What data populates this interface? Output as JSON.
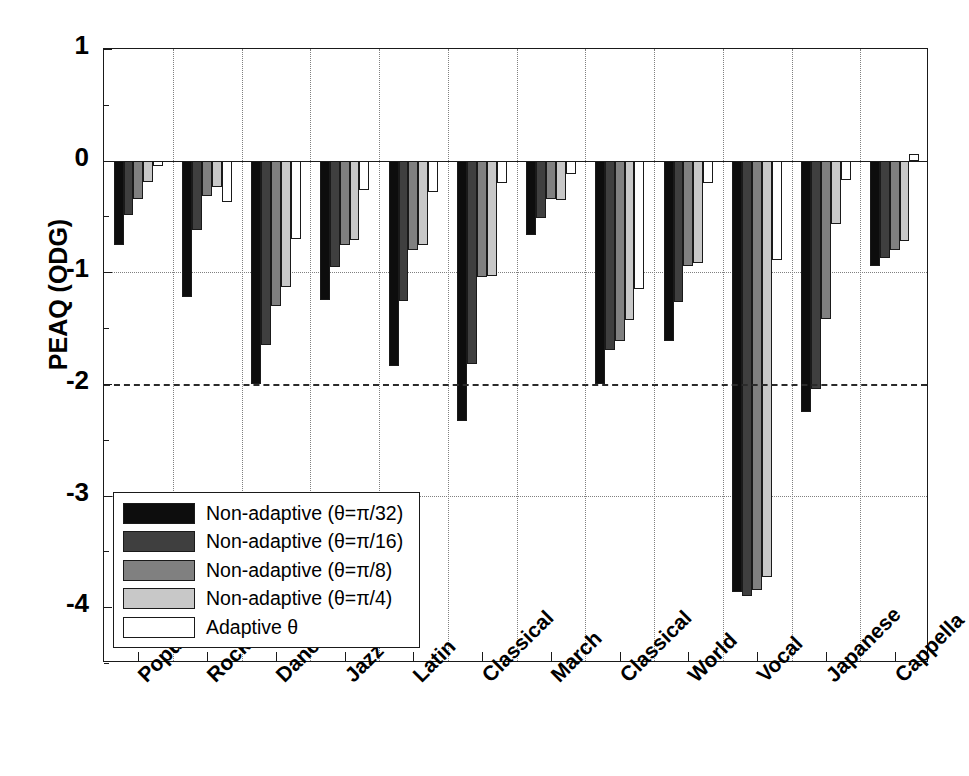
{
  "chart_data": {
    "type": "bar",
    "title": "",
    "xlabel": "",
    "ylabel": "PEAQ (ODG)",
    "ylim": [
      -4.5,
      1
    ],
    "yticks": [
      1,
      0,
      -1,
      -2,
      -3,
      -4
    ],
    "ytick_labels": [
      "1",
      "0",
      "-1",
      "-2",
      "-3",
      "-4"
    ],
    "grid": "dotted vertical gridlines between category groups; dotted horizontal gridlines at -1 and -3; solid zero line; dashed reference line at -2",
    "legend_position": "lower left, inside axes",
    "reference_line": -2,
    "categories": [
      "Popular",
      "Rock",
      "Dance",
      "Jazz",
      "Latin",
      "Classical",
      "March",
      "Classical",
      "World",
      "Vocal",
      "Japanese",
      "Cappella"
    ],
    "series": [
      {
        "name": "Non-adaptive (θ=π/32)",
        "color": "#0d0d0d",
        "values": [
          -0.76,
          -1.22,
          -2.0,
          -1.25,
          -1.84,
          -2.33,
          -0.67,
          -2.0,
          -1.62,
          -3.86,
          -2.25,
          -0.94
        ]
      },
      {
        "name": "Non-adaptive (θ=π/16)",
        "color": "#3f3f3f",
        "values": [
          -0.49,
          -0.62,
          -1.65,
          -0.95,
          -1.26,
          -1.82,
          -0.51,
          -1.7,
          -1.27,
          -3.9,
          -2.05,
          -0.87
        ]
      },
      {
        "name": "Non-adaptive (θ=π/8)",
        "color": "#808080",
        "values": [
          -0.34,
          -0.32,
          -1.3,
          -0.76,
          -0.8,
          -1.04,
          -0.34,
          -1.62,
          -0.94,
          -3.85,
          -1.42,
          -0.8
        ]
      },
      {
        "name": "Non-adaptive (θ=π/4)",
        "color": "#c8c8c8",
        "values": [
          -0.19,
          -0.24,
          -1.13,
          -0.71,
          -0.76,
          -1.03,
          -0.35,
          -1.43,
          -0.92,
          -3.73,
          -0.57,
          -0.72
        ]
      },
      {
        "name": "Adaptive θ",
        "color": "#ffffff",
        "values": [
          -0.05,
          -0.37,
          -0.7,
          -0.26,
          -0.28,
          -0.2,
          -0.12,
          -1.15,
          -0.2,
          -0.89,
          -0.17,
          0.06
        ]
      }
    ]
  },
  "axis": {
    "ylabel": "PEAQ (ODG)"
  },
  "legend": {
    "items": [
      "Non-adaptive (θ=π/32)",
      "Non-adaptive (θ=π/16)",
      "Non-adaptive (θ=π/8)",
      "Non-adaptive (θ=π/4)",
      "Adaptive θ"
    ]
  }
}
